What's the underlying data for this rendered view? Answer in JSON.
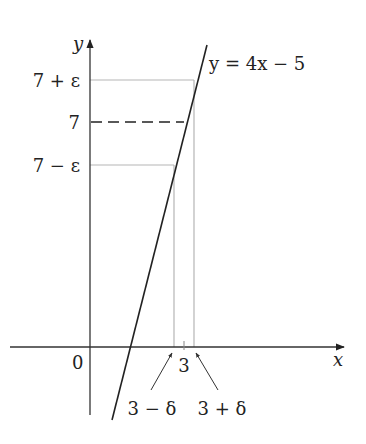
{
  "diagram": {
    "axes": {
      "x_label": "x",
      "y_label": "y",
      "origin_label": "0"
    },
    "line": {
      "equation_label": "y = 4x − 5"
    },
    "y_levels": [
      {
        "id": "upper",
        "label": "7 + ε"
      },
      {
        "id": "center",
        "label": "7",
        "style": "dashed"
      },
      {
        "id": "lower",
        "label": "7 − ε"
      }
    ],
    "x_marks": {
      "center_label": "3",
      "left_label": "3 − δ",
      "right_label": "3 + δ"
    },
    "colors": {
      "axis": "#333333",
      "curve": "#222222",
      "guide": "#b5b5b5",
      "dashed": "#222222"
    }
  }
}
